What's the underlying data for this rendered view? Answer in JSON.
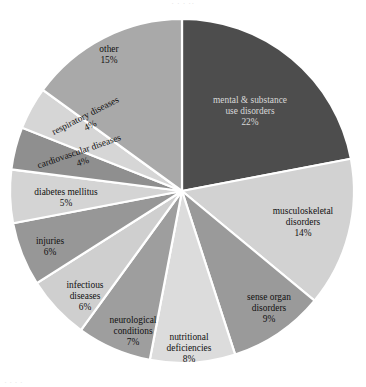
{
  "page": {
    "top_clipped_text": "·      · ·     ··",
    "bottom_clipped_text": "·  ·        ·  ·"
  },
  "chart_data": {
    "type": "pie",
    "title": "",
    "subtitle": "",
    "xlabel": "",
    "ylabel": "",
    "legend_position": "none",
    "grid": false,
    "start_angle_deg": 0,
    "direction": "clockwise",
    "categories": [
      "mental & substance use disorders",
      "musculoskeletal disorders",
      "sense organ disorders",
      "nutritional deficiencies",
      "neurological conditions",
      "infectious diseases",
      "injuries",
      "diabetes mellitus",
      "cardiovascular diseases",
      "respiratory diseases",
      "other"
    ],
    "values": [
      22,
      14,
      9,
      8,
      7,
      6,
      6,
      5,
      4,
      4,
      15
    ],
    "value_unit": "%",
    "colors": [
      "#4d4d4d",
      "#d2d2d2",
      "#9a9a9a",
      "#dcdcdc",
      "#9e9e9e",
      "#cfcfcf",
      "#979797",
      "#d4d4d4",
      "#8f8f8f",
      "#d6d6d6",
      "#a9a9a9"
    ],
    "slice_border_color": "#ffffff",
    "slices": [
      {
        "label": "mental & substance\nuse disorders",
        "line1": "mental & substance",
        "line2": "use disorders",
        "pct": "22%",
        "value": 22,
        "color": "#4d4d4d"
      },
      {
        "label": "musculoskeletal\ndisorders",
        "line1": "musculoskeletal",
        "line2": "disorders",
        "pct": "14%",
        "value": 14,
        "color": "#d2d2d2"
      },
      {
        "label": "sense organ\ndisorders",
        "line1": "sense organ",
        "line2": "disorders",
        "pct": "9%",
        "value": 9,
        "color": "#9a9a9a"
      },
      {
        "label": "nutritional\ndeficiencies",
        "line1": "nutritional",
        "line2": "deficiencies",
        "pct": "8%",
        "value": 8,
        "color": "#dcdcdc"
      },
      {
        "label": "neurological\nconditions",
        "line1": "neurological",
        "line2": "conditions",
        "pct": "7%",
        "value": 7,
        "color": "#9e9e9e"
      },
      {
        "label": "infectious\ndiseases",
        "line1": "infectious",
        "line2": "diseases",
        "pct": "6%",
        "value": 6,
        "color": "#cfcfcf"
      },
      {
        "label": "injuries",
        "line1": "injuries",
        "line2": "",
        "pct": "6%",
        "value": 6,
        "color": "#979797"
      },
      {
        "label": "diabetes mellitus",
        "line1": "diabetes mellitus",
        "line2": "",
        "pct": "5%",
        "value": 5,
        "color": "#d4d4d4"
      },
      {
        "label": "cardiovascular diseases",
        "line1": "cardiovascular diseases",
        "line2": "",
        "pct": "4%",
        "value": 4,
        "color": "#8f8f8f"
      },
      {
        "label": "respiratory diseases",
        "line1": "respiratory diseases",
        "line2": "",
        "pct": "4%",
        "value": 4,
        "color": "#d6d6d6"
      },
      {
        "label": "other",
        "line1": "other",
        "line2": "",
        "pct": "15%",
        "value": 15,
        "color": "#a9a9a9"
      }
    ]
  }
}
